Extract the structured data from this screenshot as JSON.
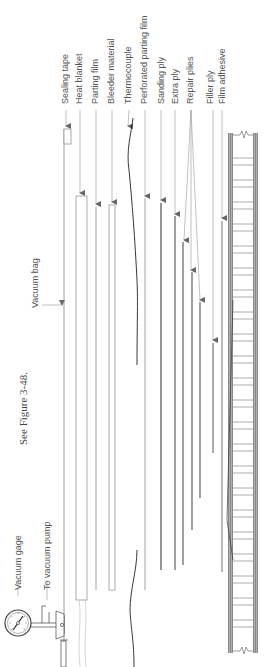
{
  "caption": "See Figure 3-48.",
  "labels": {
    "vacuum_gage": "Vacuum gage",
    "to_vacuum_pump": "To vacuum pump",
    "vacuum_bag": "Vacuum bag",
    "sealing_tape": "Sealing tape",
    "heat_blanket": "Heat blanket",
    "parting_film": "Parting film",
    "bleeder_material": "Bleeder material",
    "thermocouple": "Thermocouple",
    "perforated_parting_film": "Perforated parting film",
    "sanding_ply": "Sanding ply",
    "extra_ply": "Extra ply",
    "repair_plies": "Repair plies",
    "filler_ply": "Filler ply",
    "film_adhesive": "Film adhesive"
  },
  "colors": {
    "line": "#888888",
    "dark": "#333333",
    "text": "#555555",
    "skin": "#777777"
  }
}
